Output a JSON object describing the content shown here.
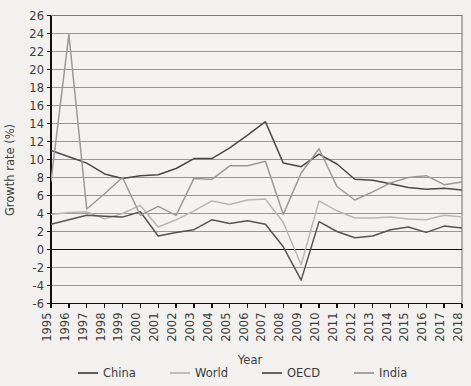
{
  "chart_data": {
    "type": "line",
    "title": "",
    "xlabel": "Year",
    "ylabel": "Growth rate (%)",
    "grid": true,
    "legend_position": "bottom",
    "xlim": [
      1995,
      2018
    ],
    "ylim": [
      -6,
      26
    ],
    "ytick_step": 2,
    "x": [
      1995,
      1996,
      1997,
      1998,
      1999,
      2000,
      2001,
      2002,
      2003,
      2004,
      2005,
      2006,
      2007,
      2008,
      2009,
      2010,
      2011,
      2012,
      2013,
      2014,
      2015,
      2016,
      2017,
      2018
    ],
    "yticks": [
      -6,
      -4,
      -2,
      0,
      2,
      4,
      6,
      8,
      10,
      12,
      14,
      16,
      18,
      20,
      22,
      24,
      26
    ],
    "xticks": [
      "1995",
      "1996",
      "1997",
      "1998",
      "1999",
      "2000",
      "2001",
      "2002",
      "2003",
      "2004",
      "2005",
      "2006",
      "2007",
      "2008",
      "2009",
      "2010",
      "2011",
      "2012",
      "2013",
      "2014",
      "2015",
      "2016",
      "2017",
      "2018"
    ],
    "series": [
      {
        "name": "China",
        "color": "#4a4a4a",
        "values": [
          11.0,
          10.3,
          9.6,
          8.4,
          7.9,
          8.2,
          8.3,
          9.0,
          10.1,
          10.1,
          11.3,
          12.7,
          14.2,
          9.6,
          9.2,
          10.6,
          9.5,
          7.8,
          7.7,
          7.3,
          6.9,
          6.7,
          6.8,
          6.6
        ]
      },
      {
        "name": "World",
        "color": "#b8b8b8",
        "values": [
          3.9,
          4.1,
          4.2,
          3.4,
          4.0,
          4.9,
          2.5,
          3.3,
          4.3,
          5.4,
          5.0,
          5.5,
          5.6,
          3.0,
          -1.7,
          5.4,
          4.3,
          3.5,
          3.5,
          3.6,
          3.4,
          3.3,
          3.8,
          3.6
        ]
      },
      {
        "name": "OECD",
        "color": "#555555",
        "values": [
          2.8,
          3.3,
          3.8,
          3.7,
          3.6,
          4.2,
          1.5,
          1.9,
          2.2,
          3.3,
          2.9,
          3.2,
          2.8,
          0.3,
          -3.4,
          3.1,
          2.0,
          1.3,
          1.5,
          2.2,
          2.5,
          1.9,
          2.6,
          2.4
        ]
      },
      {
        "name": "India",
        "color": "#9a9a9a",
        "values": [
          7.6,
          23.9,
          4.5,
          6.2,
          8.0,
          3.8,
          4.8,
          3.8,
          7.9,
          7.8,
          9.3,
          9.3,
          9.8,
          3.9,
          8.5,
          11.2,
          7.0,
          5.5,
          6.4,
          7.4,
          8.0,
          8.2,
          7.2,
          7.5
        ]
      }
    ]
  }
}
